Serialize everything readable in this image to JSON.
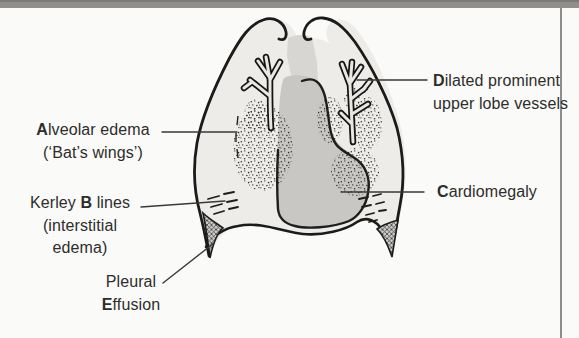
{
  "page": {
    "top_bar_color": "#908F8C",
    "background_color": "#FAFAF8",
    "page_edge_line_color": "#8E8D8B"
  },
  "diagram": {
    "colors": {
      "lung_fill": "#EDECE9",
      "mediastinum_fill": "#D7D6D3",
      "heart_fill": "#C8C7C4",
      "outline": "#1B1B1B",
      "leader_line": "#3A3938",
      "text": "#2E2D2B"
    },
    "labels": {
      "dilated_vessels": {
        "bold": "D",
        "rest": "ilated prominent",
        "line2": "upper lobe vessels"
      },
      "alveolar_edema": {
        "bold": "A",
        "rest": "lveolar edema",
        "line2": "(‘Bat’s wings’)"
      },
      "kerley_b_lines": {
        "pre": "Kerley ",
        "bold": "B",
        "post": " lines",
        "line2": "(interstitial",
        "line3": "edema)"
      },
      "pleural_effusion": {
        "line1": "Pleural",
        "bold": "E",
        "rest": "ffusion"
      },
      "cardiomegaly": {
        "bold": "C",
        "rest": "ardiomegaly"
      }
    }
  }
}
